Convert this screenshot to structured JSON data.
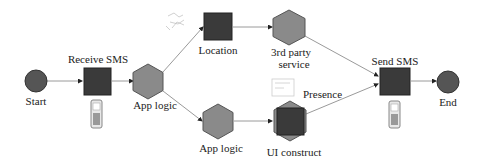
{
  "diagram": {
    "nodes": [
      {
        "id": "start",
        "label": "Start",
        "shape": "circle"
      },
      {
        "id": "receive_sms",
        "label": "Receive SMS",
        "shape": "square"
      },
      {
        "id": "app_logic_1",
        "label": "App logic",
        "shape": "hexagon"
      },
      {
        "id": "location",
        "label": "Location",
        "shape": "square"
      },
      {
        "id": "third_party",
        "label_line1": "3rd party",
        "label_line2": "service",
        "shape": "hexagon"
      },
      {
        "id": "app_logic_2",
        "label": "App logic",
        "shape": "hexagon"
      },
      {
        "id": "ui_construct",
        "label": "UI construct",
        "shape": "hexagon+square"
      },
      {
        "id": "presence",
        "label": "Presence",
        "shape": "annotation"
      },
      {
        "id": "send_sms",
        "label": "Send SMS",
        "shape": "square"
      },
      {
        "id": "end",
        "label": "End",
        "shape": "circle"
      }
    ],
    "edges": [
      {
        "from": "start",
        "to": "receive_sms"
      },
      {
        "from": "receive_sms",
        "to": "app_logic_1"
      },
      {
        "from": "app_logic_1",
        "to": "location"
      },
      {
        "from": "app_logic_1",
        "to": "app_logic_2"
      },
      {
        "from": "location",
        "to": "third_party"
      },
      {
        "from": "app_logic_2",
        "to": "ui_construct"
      },
      {
        "from": "third_party",
        "to": "send_sms"
      },
      {
        "from": "ui_construct",
        "to": "send_sms"
      },
      {
        "from": "send_sms",
        "to": "end"
      }
    ],
    "icons": [
      "mobile-phone-icon",
      "map-sketch-icon",
      "presence-sketch-icon",
      "mobile-phone-icon"
    ],
    "colors": {
      "square_fill": "#3a3a3a",
      "hexagon_fill": "#8a8a8a",
      "circle_fill": "#555555",
      "edge": "#999999",
      "arrowhead": "#222222"
    }
  }
}
